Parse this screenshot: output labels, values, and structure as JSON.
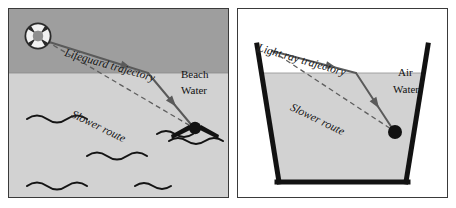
{
  "figure": {
    "width": 456,
    "height": 208,
    "background": "#ffffff",
    "border_color": "#3a3a3a"
  },
  "colors": {
    "beach_fill": "#9e9e9e",
    "water_fill": "#d2d2d2",
    "air_fill": "#ffffff",
    "line_dark": "#4a4a4a",
    "stroke_black": "#111111",
    "glass_wall": "#1a1a1a",
    "text": "#111111"
  },
  "left_panel": {
    "name": "lifeguard-beach-water-diagram",
    "regions": [
      {
        "id": "beach",
        "label": "Beach",
        "fill": "#9e9e9e"
      },
      {
        "id": "water",
        "label": "Water",
        "fill": "#d2d2d2"
      }
    ],
    "labels": {
      "beach": "Beach",
      "water": "Water",
      "trajectory": "Lifeguard trajectory",
      "slower_route": "Slower route"
    },
    "icons": {
      "start": "life-preserver-icon",
      "target": "swimmer-icon"
    },
    "waves_count": 5,
    "interface_y": 72
  },
  "right_panel": {
    "name": "light-ray-air-water-diagram",
    "regions": [
      {
        "id": "air",
        "label": "Air",
        "fill": "#ffffff"
      },
      {
        "id": "water",
        "label": "Water",
        "fill": "#d2d2d2"
      }
    ],
    "labels": {
      "air": "Air",
      "water": "Water",
      "trajectory": "Light ray trajectory",
      "slower_route": "Slower route"
    },
    "icons": {
      "target": "target-dot-icon"
    },
    "container_shape": "trapezoid-glass-tank",
    "interface_y": 72
  }
}
